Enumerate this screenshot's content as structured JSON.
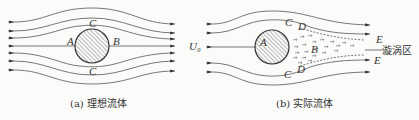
{
  "panel_a": {
    "caption": "(a) 理想流体",
    "labels": {
      "top": "C",
      "left": "A",
      "right": "B",
      "bottom": "C"
    }
  },
  "panel_b": {
    "caption": "(b) 实际流体",
    "labels": {
      "inflow": "U₀",
      "top_c": "C",
      "top_d": "D",
      "left": "A",
      "right": "B",
      "bottom_c": "C",
      "bottom_d": "D",
      "upper_e": "E",
      "lower_e": "E",
      "wake": "漩涡区"
    }
  },
  "colors": {
    "line": "#555555",
    "circle": "#333333",
    "hatch": "#666666",
    "background": "#fbfbf9"
  }
}
